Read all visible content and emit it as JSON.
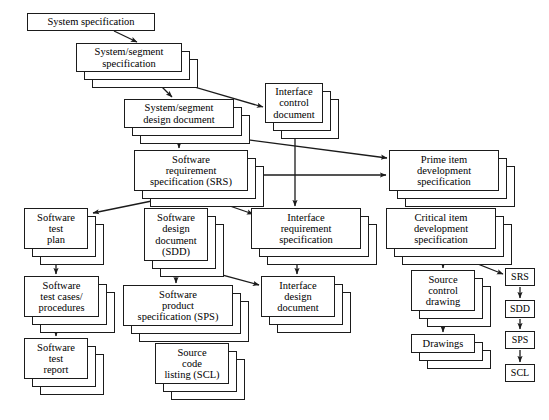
{
  "diagram": {
    "colors": {
      "line": "#1b1b1b",
      "background": "#ffffff",
      "text": "#000000"
    },
    "nodes": [
      {
        "id": "system_spec",
        "label": "System specification",
        "x": 27,
        "y": 13,
        "w": 128,
        "h": 18,
        "stacked": false
      },
      {
        "id": "sys_seg_spec",
        "label": "System/segment\nspecification",
        "x": 76,
        "y": 43,
        "w": 106,
        "h": 29,
        "stacked": true
      },
      {
        "id": "sys_seg_design",
        "label": "System/segment\ndesign document",
        "x": 124,
        "y": 99,
        "w": 110,
        "h": 29,
        "stacked": true
      },
      {
        "id": "interface_control",
        "label": "Interface\ncontrol\ndocument",
        "x": 265,
        "y": 83,
        "w": 58,
        "h": 40,
        "stacked": true
      },
      {
        "id": "prime_item",
        "label": "Prime item\ndevelopment\nspecification",
        "x": 389,
        "y": 150,
        "w": 110,
        "h": 41,
        "stacked": true
      },
      {
        "id": "srs",
        "label": "Software\nrequirement\nspecification (SRS)",
        "x": 134,
        "y": 150,
        "w": 114,
        "h": 41,
        "stacked": true
      },
      {
        "id": "critical_item",
        "label": "Critical item\ndevelopment\nspecification",
        "x": 386,
        "y": 208,
        "w": 110,
        "h": 41,
        "stacked": true
      },
      {
        "id": "sw_test_plan",
        "label": "Software\ntest\nplan",
        "x": 24,
        "y": 208,
        "w": 64,
        "h": 41,
        "stacked": true
      },
      {
        "id": "sdd",
        "label": "Software\ndesign\ndocument\n(SDD)",
        "x": 144,
        "y": 208,
        "w": 64,
        "h": 53,
        "stacked": true
      },
      {
        "id": "interface_req",
        "label": "Interface\nrequirement\nspecification",
        "x": 251,
        "y": 208,
        "w": 110,
        "h": 41,
        "stacked": true
      },
      {
        "id": "source_control",
        "label": "Source\ncontrol\ndrawing",
        "x": 411,
        "y": 270,
        "w": 64,
        "h": 41,
        "stacked": true
      },
      {
        "id": "sw_test_cases",
        "label": "Software\ntest cases/\nprocedures",
        "x": 24,
        "y": 276,
        "w": 75,
        "h": 41,
        "stacked": true
      },
      {
        "id": "sps",
        "label": "Software\nproduct\nspecification (SPS)",
        "x": 123,
        "y": 285,
        "w": 110,
        "h": 41,
        "stacked": true
      },
      {
        "id": "interface_design",
        "label": "Interface\ndesign\ndocument",
        "x": 261,
        "y": 276,
        "w": 74,
        "h": 41,
        "stacked": true
      },
      {
        "id": "drawings",
        "label": "Drawings",
        "x": 411,
        "y": 334,
        "w": 64,
        "h": 19,
        "stacked": true
      },
      {
        "id": "sw_test_report",
        "label": "Software\ntest\nreport",
        "x": 24,
        "y": 338,
        "w": 64,
        "h": 41,
        "stacked": true
      },
      {
        "id": "source_code",
        "label": "Source\ncode\nlisting (SCL)",
        "x": 155,
        "y": 343,
        "w": 74,
        "h": 41,
        "stacked": true
      },
      {
        "id": "leg_srs",
        "label": "SRS",
        "x": 505,
        "y": 268,
        "w": 30,
        "h": 18,
        "stacked": false
      },
      {
        "id": "leg_sdd",
        "label": "SDD",
        "x": 505,
        "y": 300,
        "w": 30,
        "h": 18,
        "stacked": false
      },
      {
        "id": "leg_sps",
        "label": "SPS",
        "x": 505,
        "y": 331,
        "w": 30,
        "h": 18,
        "stacked": false
      },
      {
        "id": "leg_scl",
        "label": "SCL",
        "x": 505,
        "y": 364,
        "w": 30,
        "h": 18,
        "stacked": false
      }
    ],
    "edges": [
      {
        "from": "system_spec",
        "to": "sys_seg_spec",
        "points": "114,31 137,42",
        "arrow": "end"
      },
      {
        "from": "sys_seg_spec",
        "to": "sys_seg_design",
        "points": "148,73 172,97",
        "arrow": "end"
      },
      {
        "from": "sys_seg_spec",
        "to": "interface_control",
        "points": "150,74 263,107",
        "arrow": "end"
      },
      {
        "from": "sys_seg_design",
        "to": "srs",
        "points": "179,129 179,148",
        "arrow": "end"
      },
      {
        "from": "sys_seg_design",
        "to": "prime_item",
        "points": "181,131 387,158",
        "arrow": "end"
      },
      {
        "from": "srs",
        "to": "prime_item",
        "points": "251,175 386,175",
        "arrow": "both"
      },
      {
        "from": "interface_control",
        "to": "interface_req",
        "points": "295,131 295,206",
        "arrow": "end"
      },
      {
        "from": "prime_item",
        "to": "critical_item",
        "points": "443,192 443,206",
        "arrow": "end"
      },
      {
        "from": "srs",
        "to": "sw_test_plan",
        "points": "186,194 93,213",
        "arrow": "end"
      },
      {
        "from": "srs",
        "to": "sdd",
        "points": "191,194 191,206",
        "arrow": "end"
      },
      {
        "from": "srs",
        "to": "interface_req",
        "points": "195,194 253,214",
        "arrow": "end"
      },
      {
        "from": "sw_test_plan",
        "to": "sw_test_cases",
        "points": "56,250 56,274",
        "arrow": "end"
      },
      {
        "from": "sdd",
        "to": "sps",
        "points": "176,262 176,283",
        "arrow": "end"
      },
      {
        "from": "sdd",
        "to": "interface_design",
        "points": "178,263 259,285",
        "arrow": "end"
      },
      {
        "from": "interface_req",
        "to": "interface_design",
        "points": "297,250 297,274",
        "arrow": "end"
      },
      {
        "from": "critical_item",
        "to": "source_control",
        "points": "443,250 443,268",
        "arrow": "end"
      },
      {
        "from": "critical_item",
        "to": "leg_srs",
        "points": "445,251 503,274",
        "arrow": "end"
      },
      {
        "from": "sw_test_cases",
        "to": "sw_test_report",
        "points": "56,318 56,336",
        "arrow": "end"
      },
      {
        "from": "sps",
        "to": "source_code",
        "points": "176,327 176,341",
        "arrow": "end"
      },
      {
        "from": "source_control",
        "to": "drawings",
        "points": "443,312 443,332",
        "arrow": "end"
      },
      {
        "from": "leg_srs",
        "to": "leg_sdd",
        "points": "520,287 520,298",
        "arrow": "end"
      },
      {
        "from": "leg_sdd",
        "to": "leg_sps",
        "points": "520,319 520,329",
        "arrow": "end"
      },
      {
        "from": "leg_sps",
        "to": "leg_scl",
        "points": "520,350 520,362",
        "arrow": "end"
      }
    ],
    "caption": ""
  }
}
